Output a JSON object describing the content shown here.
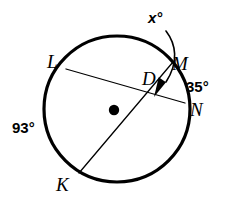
{
  "figure": {
    "kind": "circle-geometry-diagram",
    "width": 226,
    "height": 204,
    "background_color": "#ffffff",
    "stroke_color": "#000000"
  },
  "circle": {
    "name": "main-circle",
    "center_x": 117,
    "center_y": 109,
    "radius": 73,
    "stroke_width": 3.2,
    "fill": "none"
  },
  "center_dot": {
    "name": "circle-center-point",
    "x": 114,
    "y": 110,
    "radius": 5.2,
    "fill": "#000000"
  },
  "chords": [
    {
      "name": "chord-LN",
      "from_label": "L",
      "to_label": "N",
      "x1": 66,
      "y1": 69,
      "x2": 185,
      "y2": 103,
      "stroke_width": 1.3
    },
    {
      "name": "chord-KM",
      "from_label": "K",
      "to_label": "M",
      "x1": 79,
      "y1": 173,
      "x2": 173,
      "y2": 62,
      "stroke_width": 1.3
    }
  ],
  "intersection": {
    "name": "point-D",
    "x": 156,
    "y": 95
  },
  "vertex_labels": [
    {
      "id": "label-L",
      "name": "vertex-label-L",
      "text": "L"
    },
    {
      "id": "label-K",
      "name": "vertex-label-K",
      "text": "K"
    },
    {
      "id": "label-M",
      "name": "vertex-label-M",
      "text": "M"
    },
    {
      "id": "label-N",
      "name": "vertex-label-N",
      "text": "N"
    },
    {
      "id": "label-D",
      "name": "vertex-label-D",
      "text": "D"
    }
  ],
  "points": {
    "L": "L",
    "K": "K",
    "M": "M",
    "N": "N",
    "D": "D"
  },
  "angle_labels": {
    "unknown": "x°",
    "arc_MN": "35°",
    "arc_KL": "93°"
  },
  "leader_arrow": {
    "name": "x-angle-leader-arrow",
    "path": "M 166,31 C 176,44 179,62 166,82",
    "tip_x": 154,
    "tip_y": 97,
    "stroke_width": 1.6,
    "arrowhead": "filled-triangle"
  },
  "chart_data": {
    "type": "diagram",
    "given": [
      {
        "label": "arc KL",
        "value": 93,
        "unit": "degrees"
      },
      {
        "label": "arc MN",
        "value": 35,
        "unit": "degrees"
      }
    ],
    "unknown": {
      "label": "angle x at D",
      "value": null,
      "unit": "degrees"
    }
  }
}
